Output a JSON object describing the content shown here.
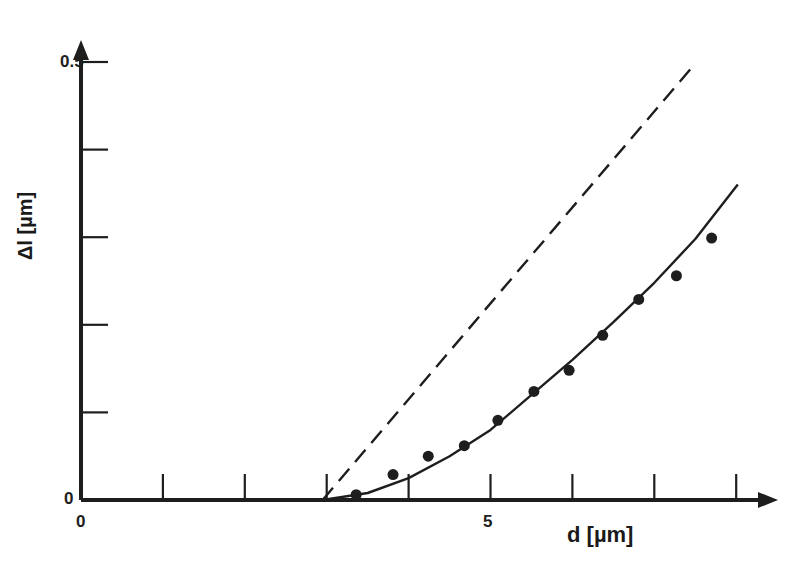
{
  "chart_data": {
    "type": "scatter",
    "title": "",
    "xlabel": "d [µm]",
    "ylabel": "Δl [µm]",
    "xlim": [
      0,
      8.5
    ],
    "ylim": [
      0,
      0.5
    ],
    "x_ticks": [
      0,
      1,
      2,
      3,
      4,
      5,
      6,
      7,
      8
    ],
    "x_tick_labels": [
      "0",
      "",
      "",
      "",
      "",
      "5",
      "",
      "",
      ""
    ],
    "y_ticks": [
      0,
      0.1,
      0.2,
      0.3,
      0.4,
      0.5
    ],
    "y_tick_labels": [
      "0",
      "",
      "",
      "",
      "",
      "0.5"
    ],
    "grid": false,
    "legend": null,
    "series": [
      {
        "name": "measured",
        "style": "dots",
        "x": [
          3.36,
          3.81,
          4.24,
          4.68,
          5.09,
          5.53,
          5.96,
          6.37,
          6.81,
          7.27,
          7.7
        ],
        "y": [
          0.006,
          0.029,
          0.05,
          0.062,
          0.091,
          0.124,
          0.148,
          0.188,
          0.229,
          0.256,
          0.299
        ]
      },
      {
        "name": "fit curve",
        "style": "solid",
        "x": [
          2.95,
          3.5,
          4.0,
          4.5,
          5.0,
          5.5,
          6.0,
          6.5,
          7.0,
          7.5,
          8.02
        ],
        "y": [
          0.0,
          0.008,
          0.025,
          0.05,
          0.08,
          0.12,
          0.16,
          0.203,
          0.248,
          0.298,
          0.36
        ]
      },
      {
        "name": "linear reference",
        "style": "dashed",
        "x": [
          2.95,
          7.47
        ],
        "y": [
          0.0,
          0.495
        ]
      }
    ]
  },
  "labels": {
    "x_axis": "d [µm]",
    "y_axis": "Δl [µm]",
    "x_origin": "0",
    "x_five": "5",
    "y_origin": "0",
    "y_top": "0.5"
  }
}
